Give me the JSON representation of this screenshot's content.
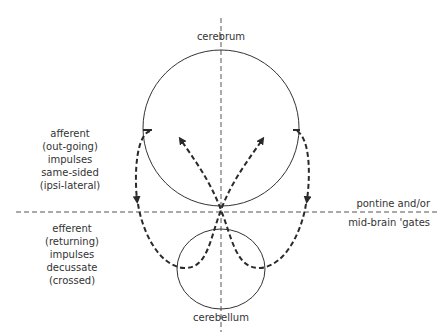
{
  "diagram": {
    "type": "anatomical-schematic",
    "labels": {
      "cerebrum": "cerebrum",
      "cerebellum": "cerebellum",
      "gate_top": "pontine and/or",
      "gate_bottom": "mid-brain 'gates"
    },
    "afferent_label": {
      "lines": [
        "afferent",
        "(out-going)",
        "impulses",
        "same-sided",
        "(ipsi-lateral)"
      ]
    },
    "efferent_label": {
      "lines": [
        "efferent",
        "(returning)",
        "impulses",
        "decussate",
        "(crossed)"
      ]
    },
    "colors": {
      "line": "#333333",
      "dashed_path": "#2a2a2a",
      "background": "#ffffff"
    }
  }
}
